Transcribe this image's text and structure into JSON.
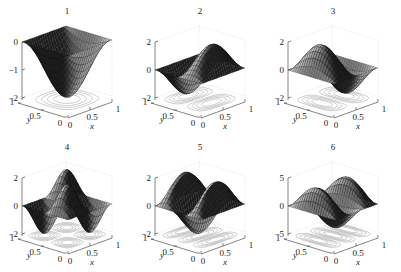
{
  "figure": {
    "background": "#ffffff",
    "surface_dark": "#1a1a1a",
    "surface_light": "#f2f2f2",
    "contour_color": "#9a9a9a",
    "axis_color": "#333333",
    "grid_color": "#c8c8c8"
  },
  "chart_data": [
    {
      "type": "surface",
      "title": "1",
      "function": "-2*sin(pi x)*sin(pi y)",
      "zlim": [
        -2,
        0
      ],
      "zticks": [
        "0",
        "−1",
        "−2"
      ],
      "xlabel": "x",
      "ylabel": "y",
      "xticks": [
        "0",
        "0.5",
        "1"
      ],
      "yticks": [
        "0",
        "0.5",
        "1"
      ],
      "contours": true
    },
    {
      "type": "surface",
      "title": "2",
      "function": "2*sin(pi x)*sin(2 pi y)",
      "zlim": [
        -2,
        2
      ],
      "zticks": [
        "2",
        "0",
        "−2"
      ],
      "xlabel": "x",
      "ylabel": "y",
      "xticks": [
        "0",
        "0.5",
        "1"
      ],
      "yticks": [
        "0",
        "0.5",
        "1"
      ],
      "contours": true
    },
    {
      "type": "surface",
      "title": "3",
      "function": "2*sin(2 pi x)*sin(pi y)",
      "zlim": [
        -2,
        2
      ],
      "zticks": [
        "2",
        "0",
        "−2"
      ],
      "xlabel": "x",
      "ylabel": "y",
      "xticks": [
        "0",
        "0.5",
        "1"
      ],
      "yticks": [
        "0",
        "0.5",
        "1"
      ],
      "contours": true
    },
    {
      "type": "surface",
      "title": "4",
      "function": "2*sin(2 pi x)*sin(2 pi y)",
      "zlim": [
        -2,
        2
      ],
      "zticks": [
        "2",
        "0",
        "−2"
      ],
      "xlabel": "x",
      "ylabel": "y",
      "xticks": [
        "0",
        "0.5",
        "1"
      ],
      "yticks": [
        "0",
        "0.5",
        "1"
      ],
      "contours": true
    },
    {
      "type": "surface",
      "title": "5",
      "function": "2*sin(pi x)*sin(3 pi y)",
      "zlim": [
        -2,
        2
      ],
      "zticks": [
        "2",
        "0",
        "−2"
      ],
      "xlabel": "x",
      "ylabel": "y",
      "xticks": [
        "0",
        "0.5",
        "1"
      ],
      "yticks": [
        "0",
        "0.5",
        "1"
      ],
      "contours": true
    },
    {
      "type": "surface",
      "title": "6",
      "function": "4*sin(3 pi x)*sin(pi y)",
      "zlim": [
        -5,
        5
      ],
      "zticks": [
        "5",
        "0",
        "−5"
      ],
      "xlabel": "x",
      "ylabel": "y",
      "xticks": [
        "0",
        "0.5",
        "1"
      ],
      "yticks": [
        "0",
        "0.5",
        "1"
      ],
      "contours": true
    }
  ],
  "panels": [
    {
      "title": "1",
      "kx": 1,
      "ky": 1,
      "amp": -2,
      "offset": 0,
      "zmin": -2,
      "zmax": 0,
      "zt": [
        "0",
        "−1",
        "−2"
      ],
      "zv": [
        0,
        -1,
        -2
      ]
    },
    {
      "title": "2",
      "kx": 1,
      "ky": 2,
      "amp": 2,
      "offset": 0,
      "zmin": -2,
      "zmax": 2,
      "zt": [
        "2",
        "0",
        "−2"
      ],
      "zv": [
        2,
        0,
        -2
      ]
    },
    {
      "title": "3",
      "kx": 2,
      "ky": 1,
      "amp": 2,
      "offset": 0,
      "zmin": -2,
      "zmax": 2,
      "zt": [
        "2",
        "0",
        "−2"
      ],
      "zv": [
        2,
        0,
        -2
      ]
    },
    {
      "title": "4",
      "kx": 2,
      "ky": 2,
      "amp": 2,
      "offset": 0,
      "zmin": -2,
      "zmax": 2,
      "zt": [
        "2",
        "0",
        "−2"
      ],
      "zv": [
        2,
        0,
        -2
      ]
    },
    {
      "title": "5",
      "kx": 1,
      "ky": 3,
      "amp": 2,
      "offset": 0,
      "zmin": -2,
      "zmax": 2,
      "zt": [
        "2",
        "0",
        "−2"
      ],
      "zv": [
        2,
        0,
        -2
      ]
    },
    {
      "title": "6",
      "kx": 3,
      "ky": 1,
      "amp": 4,
      "offset": 0,
      "zmin": -5,
      "zmax": 5,
      "zt": [
        "5",
        "0",
        "−5"
      ],
      "zv": [
        5,
        0,
        -5
      ]
    }
  ],
  "labels": {
    "x": "x",
    "y": "y",
    "t0": "0",
    "t05": "0.5",
    "t1": "1"
  }
}
